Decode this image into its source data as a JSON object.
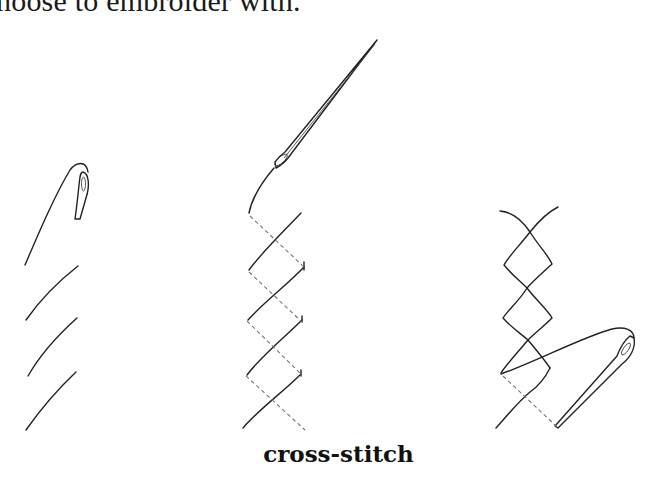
{
  "page": {
    "top_text": "hoose to embroider with.",
    "caption": "cross-stitch"
  },
  "figures": [
    {
      "name": "step-1",
      "description": "needle and thread with three parallel diagonal stitches"
    },
    {
      "name": "step-2",
      "description": "needle pulling thread with diagonal stitches and dashed back-thread path"
    },
    {
      "name": "step-3",
      "description": "completed crossed stitches with needle returning"
    }
  ]
}
